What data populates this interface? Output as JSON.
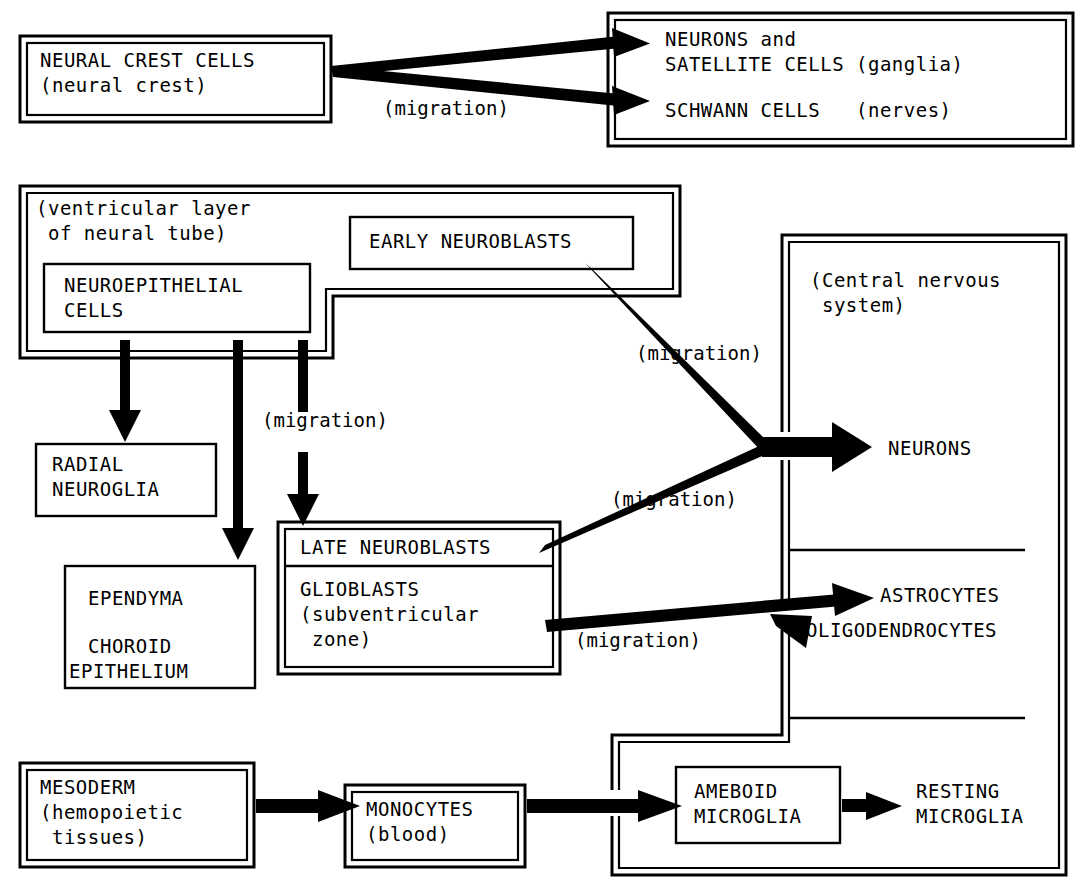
{
  "diagram": {
    "ink_color": "#000000",
    "background_color": "#ffffff",
    "nodes": [
      {
        "id": "neural-crest-cells",
        "lines": [
          "NEURAL CREST CELLS",
          "(neural crest)"
        ],
        "border": "double"
      },
      {
        "id": "peripheral-nervous-system",
        "lines": [
          "NEURONS and",
          "SATELLITE CELLS (ganglia)",
          "",
          "SCHWANN CELLS   (nerves)"
        ],
        "border": "double"
      },
      {
        "id": "ventricular-layer",
        "lines": [
          "(ventricular layer",
          " of neural tube)"
        ],
        "border": "double"
      },
      {
        "id": "neuroepithelial-cells",
        "lines": [
          "NEUROEPITHELIAL",
          "CELLS"
        ],
        "border": "single"
      },
      {
        "id": "early-neuroblasts",
        "lines": [
          "EARLY NEUROBLASTS"
        ],
        "border": "single"
      },
      {
        "id": "radial-neuroglia",
        "lines": [
          "RADIAL",
          "NEUROGLIA"
        ],
        "border": "single"
      },
      {
        "id": "ependyma-choroid",
        "lines": [
          "EPENDYMA",
          "",
          "CHOROID",
          "EPITHELIUM"
        ],
        "border": "single"
      },
      {
        "id": "late-neuroblasts",
        "lines": [
          "LATE NEUROBLASTS"
        ],
        "border": "double-top-cell"
      },
      {
        "id": "glioblasts",
        "lines": [
          "GLIOBLASTS",
          "(subventricular",
          " zone)"
        ],
        "border": "double-bottom-cell"
      },
      {
        "id": "central-nervous-system",
        "lines": [
          "(Central nervous",
          " system)"
        ],
        "border": "double"
      },
      {
        "id": "mesoderm",
        "lines": [
          "MESODERM",
          "(hemopoietic",
          " tissues)"
        ],
        "border": "double"
      },
      {
        "id": "monocytes",
        "lines": [
          "MONOCYTES",
          "(blood)"
        ],
        "border": "double"
      },
      {
        "id": "ameboid-microglia",
        "lines": [
          "AMEBOID",
          "MICROGLIA"
        ],
        "border": "single"
      }
    ],
    "outputs": [
      {
        "id": "neurons-cns",
        "label": "NEURONS"
      },
      {
        "id": "astrocytes",
        "label": "ASTROCYTES"
      },
      {
        "id": "oligodendrocytes",
        "label": "OLIGODENDROCYTES"
      },
      {
        "id": "resting-microglia",
        "lines": [
          "RESTING",
          "MICROGLIA"
        ]
      }
    ],
    "edge_labels": [
      {
        "id": "migration-crest",
        "text": "(migration)"
      },
      {
        "id": "migration-early-neuroblasts",
        "text": "(migration)"
      },
      {
        "id": "migration-neuroepithelial",
        "text": "(migration)"
      },
      {
        "id": "migration-late-neuroblasts",
        "text": "(migration)"
      },
      {
        "id": "migration-glioblasts",
        "text": "(migration)"
      }
    ],
    "text": {
      "neural_crest_cells_l1": "NEURAL CREST CELLS",
      "neural_crest_cells_l2": "(neural crest)",
      "pns_l1": "NEURONS and",
      "pns_l2": "SATELLITE CELLS (ganglia)",
      "pns_l3": "SCHWANN CELLS   (nerves)",
      "ventricular_l1": "(ventricular layer",
      "ventricular_l2": " of neural tube)",
      "neuroepithelial_l1": "NEUROEPITHELIAL",
      "neuroepithelial_l2": "CELLS",
      "early_neuroblasts": "EARLY NEUROBLASTS",
      "radial_l1": "RADIAL",
      "radial_l2": "NEUROGLIA",
      "ependyma_l1": "EPENDYMA",
      "ependyma_l2": "CHOROID",
      "ependyma_l3": "EPITHELIUM",
      "late_neuroblasts": "LATE NEUROBLASTS",
      "glioblasts_l1": "GLIOBLASTS",
      "glioblasts_l2": "(subventricular",
      "glioblasts_l3": " zone)",
      "cns_l1": "(Central nervous",
      "cns_l2": " system)",
      "neurons_cns": "NEURONS",
      "astrocytes": "ASTROCYTES",
      "oligodendrocytes": "OLIGODENDROCYTES",
      "mesoderm_l1": "MESODERM",
      "mesoderm_l2": "(hemopoietic",
      "mesoderm_l3": " tissues)",
      "monocytes_l1": "MONOCYTES",
      "monocytes_l2": "(blood)",
      "ameboid_l1": "AMEBOID",
      "ameboid_l2": "MICROGLIA",
      "resting_l1": "RESTING",
      "resting_l2": "MICROGLIA",
      "migration_1": "(migration)",
      "migration_2": "(migration)",
      "migration_3": "(migration)",
      "migration_4": "(migration)",
      "migration_5": "(migration)"
    }
  }
}
